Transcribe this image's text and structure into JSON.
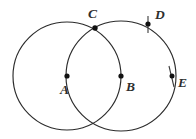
{
  "figure": {
    "background_color": "#ffffff",
    "stroke_color": "#2b2b2b",
    "point_color": "#111111",
    "label_color": "#2e2e2e",
    "circles": [
      {
        "name": "circle-a",
        "center_label": "A",
        "cx": 67,
        "cy": 76,
        "r": 54
      },
      {
        "name": "circle-b",
        "center_label": "B",
        "cx": 121,
        "cy": 76,
        "r": 55
      }
    ],
    "points": [
      {
        "id": "A",
        "label": "A",
        "x": 67,
        "y": 76,
        "label_x": 60,
        "label_y": 94,
        "has_tick": false,
        "role": "center-of-left-circle"
      },
      {
        "id": "B",
        "label": "B",
        "x": 121,
        "y": 76,
        "label_x": 126,
        "label_y": 91,
        "has_tick": false,
        "role": "center-of-right-circle"
      },
      {
        "id": "C",
        "label": "C",
        "x": 95,
        "y": 28,
        "label_x": 88,
        "label_y": 18,
        "has_tick": false,
        "role": "upper-intersection"
      },
      {
        "id": "D",
        "label": "D",
        "x": 148,
        "y": 24,
        "label_x": 155,
        "label_y": 19,
        "has_tick": true,
        "role": "on-right-circle"
      },
      {
        "id": "E",
        "label": "E",
        "x": 172,
        "y": 76,
        "label_x": 178,
        "label_y": 87,
        "has_tick": true,
        "role": "on-right-circle"
      }
    ],
    "ticks": [
      {
        "id": "tick-D",
        "x1": 148,
        "y1": 16,
        "x2": 148,
        "y2": 33
      },
      {
        "id": "tick-E",
        "x1": 169,
        "y1": 66,
        "x2": 174,
        "y2": 87
      }
    ]
  }
}
